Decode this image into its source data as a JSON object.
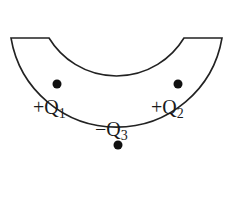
{
  "diagram": {
    "shape": "semicircular-arc-conductor",
    "colors": {
      "stroke": "#222222",
      "fill": "#ffffff",
      "charge": "#111111"
    },
    "charges": [
      {
        "id": "q1",
        "sign": "+",
        "symbol": "Q",
        "sub": "1",
        "dot": {
          "x": 57,
          "y": 84
        },
        "label": {
          "x": 33,
          "y": 114
        }
      },
      {
        "id": "q2",
        "sign": "+",
        "symbol": "Q",
        "sub": "2",
        "dot": {
          "x": 178,
          "y": 84
        },
        "label": {
          "x": 151,
          "y": 114
        }
      },
      {
        "id": "q3",
        "sign": "−",
        "symbol": "Q",
        "sub": "3",
        "dot": {
          "x": 118,
          "y": 145
        },
        "label": {
          "x": 95,
          "y": 136
        }
      }
    ]
  }
}
